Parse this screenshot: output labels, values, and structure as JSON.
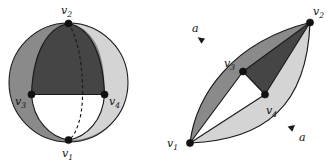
{
  "figure": {
    "caption": "",
    "colors": {
      "dark_face": "#454545",
      "medium_face": "#8a8a8a",
      "light_face": "#d4d4d4",
      "white_face": "#ffffff",
      "outline": "#1a1a1a",
      "node": "#111111",
      "background": "#ffffff"
    },
    "left_panel": {
      "name": "sphere-diagram",
      "shape": "sphere",
      "circle": {
        "cx": 68.5,
        "cy": 82.5,
        "r": 59.5
      },
      "vertices": [
        {
          "id": "v1",
          "label": "v",
          "sub": "1",
          "x": 68.5,
          "y": 140.0,
          "label_x": 64.0,
          "label_y": 156.0
        },
        {
          "id": "v2",
          "label": "v",
          "sub": "2",
          "x": 68.5,
          "y": 23.5,
          "label_x": 61.0,
          "label_y": 13.0
        },
        {
          "id": "v3",
          "label": "v",
          "sub": "3",
          "x": 31.5,
          "y": 94.5,
          "label_x": 14.0,
          "label_y": 104.0
        },
        {
          "id": "v4",
          "label": "v",
          "sub": "4",
          "x": 104.5,
          "y": 94.5,
          "label_x": 108.0,
          "label_y": 104.0
        }
      ]
    },
    "right_panel": {
      "name": "planar-lens-diagram",
      "shape": "lens-quadrilateral",
      "vertices": [
        {
          "id": "v1",
          "label": "v",
          "sub": "1",
          "x": 190.0,
          "y": 143.0,
          "label_x": 168.0,
          "label_y": 147.0
        },
        {
          "id": "v2",
          "label": "v",
          "sub": "2",
          "x": 310.0,
          "y": 22.5,
          "label_x": 314.0,
          "label_y": 15.0
        },
        {
          "id": "v3",
          "label": "v",
          "sub": "3",
          "x": 243.0,
          "y": 71.5,
          "label_x": 224.0,
          "label_y": 66.0
        },
        {
          "id": "v4",
          "label": "v",
          "sub": "4",
          "x": 265.0,
          "y": 94.5,
          "label_x": 268.0,
          "label_y": 112.0
        }
      ],
      "edge_labels": [
        {
          "id": "a-top",
          "text": "a",
          "x": 194.0,
          "y": 32.0
        },
        {
          "id": "a-bottom",
          "text": "a",
          "x": 300.0,
          "y": 140.0
        }
      ]
    }
  }
}
